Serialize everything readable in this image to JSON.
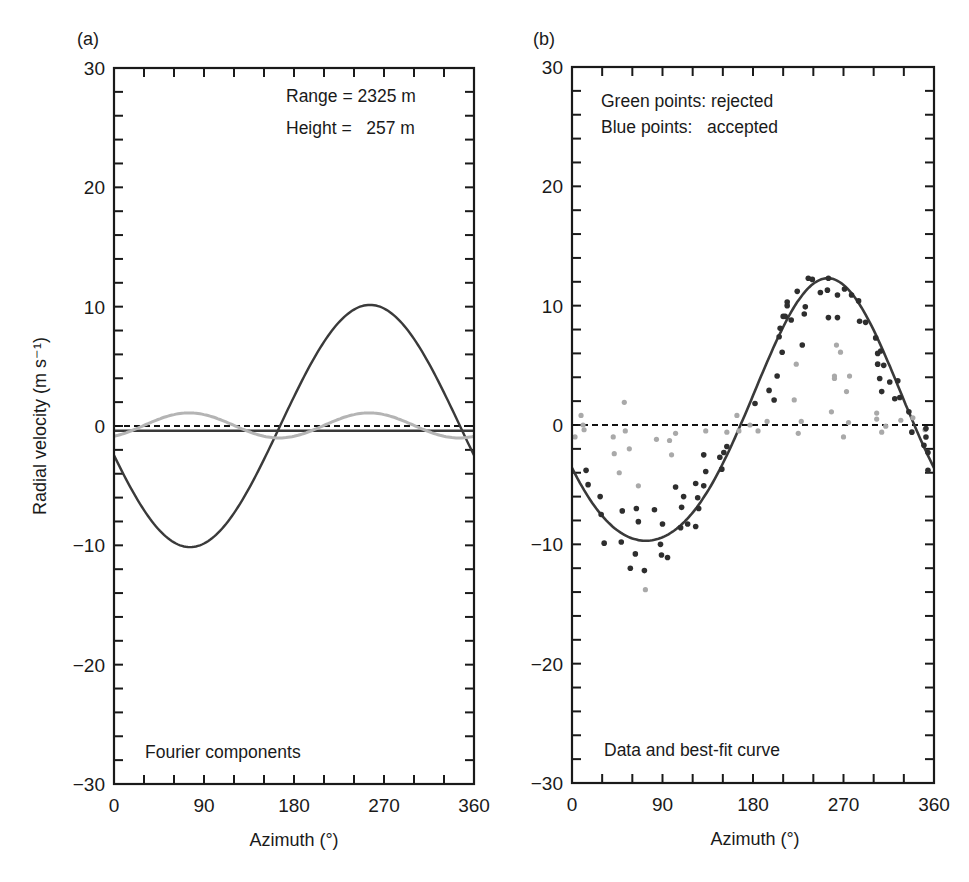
{
  "figure": {
    "ylabel": "Radial velocity (m s⁻¹)",
    "xlabel": "Azimuth (°)"
  },
  "colors": {
    "frame": "#1a1a1a",
    "dark_curve": "#3a3a3a",
    "light_curve": "#b4b4b4",
    "accepted_points": "#2e2e2e",
    "rejected_points": "#a9a9a9",
    "zero_line": "#111111"
  },
  "chart_data": [
    {
      "type": "line",
      "panel_label": "(a)",
      "title": "Fourier components",
      "annotations": [
        "Range = 2325 m",
        "Height =   257 m"
      ],
      "xlabel": "Azimuth (°)",
      "ylabel": "Radial velocity (m s⁻¹)",
      "xlim": [
        0,
        360
      ],
      "ylim": [
        -30,
        30
      ],
      "xticks": [
        0,
        90,
        180,
        270,
        360
      ],
      "yticks": [
        -30,
        -20,
        -10,
        0,
        10,
        20,
        30
      ],
      "minor_xtick_step": 30,
      "minor_ytick_step": 2,
      "zero_line": "dashed",
      "series": [
        {
          "name": "mean (zeroth harmonic)",
          "style": "solid-dark",
          "model": {
            "mean": -0.4,
            "a1": 0,
            "p1": 0,
            "a2": 0,
            "p2": 0
          }
        },
        {
          "name": "first harmonic",
          "style": "solid-dark",
          "model": {
            "mean": 0,
            "a1": 10.15,
            "p1": 256,
            "a2": 0,
            "p2": 0
          }
        },
        {
          "name": "second harmonic",
          "style": "solid-light",
          "model": {
            "mean": 0.05,
            "a1": 0,
            "p1": 0,
            "a2": 1.05,
            "p2": 75
          }
        }
      ],
      "key_points": {
        "first_harmonic_min": {
          "azimuth": 76,
          "value": -10.1
        },
        "first_harmonic_max": {
          "azimuth": 256,
          "value": 10.2
        },
        "second_harmonic_peaks_azimuth": [
          75,
          255
        ],
        "second_harmonic_amplitude": 1.05
      }
    },
    {
      "type": "scatter",
      "panel_label": "(b)",
      "title": "Data and best-fit curve",
      "annotations": [
        "Green points: rejected",
        "Blue points:   accepted"
      ],
      "xlabel": "Azimuth (°)",
      "xlim": [
        0,
        360
      ],
      "ylim": [
        -30,
        30
      ],
      "xticks": [
        0,
        90,
        180,
        270,
        360
      ],
      "yticks": [
        -30,
        -20,
        -10,
        0,
        10,
        20,
        30
      ],
      "minor_xtick_step": 30,
      "minor_ytick_step": 2,
      "zero_line": "dashed",
      "fit_curve": {
        "name": "best-fit curve",
        "model": {
          "mean": 0.3,
          "a1": 11.0,
          "p1": 254,
          "a2": 1.0,
          "p2": 255
        },
        "min": {
          "azimuth": 77.5,
          "value": -9.9
        },
        "max": {
          "azimuth": 255,
          "value": 12.1
        }
      },
      "series": [
        {
          "name": "accepted",
          "points": [
            [
              14,
              -3.8
            ],
            [
              16,
              -5.0
            ],
            [
              28,
              -6.0
            ],
            [
              29,
              -7.5
            ],
            [
              32,
              -9.9
            ],
            [
              49,
              -9.8
            ],
            [
              50,
              -7.2
            ],
            [
              58,
              -12.0
            ],
            [
              63,
              -10.8
            ],
            [
              64,
              -7.0
            ],
            [
              66,
              -8.1
            ],
            [
              72,
              -12.2
            ],
            [
              82,
              -7.1
            ],
            [
              88,
              -10.0
            ],
            [
              89,
              -10.9
            ],
            [
              90,
              -8.3
            ],
            [
              95,
              -11.1
            ],
            [
              103,
              -5.2
            ],
            [
              108,
              -8.6
            ],
            [
              109,
              -6.9
            ],
            [
              111,
              -6.0
            ],
            [
              115,
              -8.3
            ],
            [
              123,
              -4.9
            ],
            [
              123,
              -8.5
            ],
            [
              125,
              -6.1
            ],
            [
              126,
              -7.0
            ],
            [
              131,
              -2.5
            ],
            [
              131,
              -5.1
            ],
            [
              133,
              -3.9
            ],
            [
              147,
              -2.7
            ],
            [
              149,
              -3.7
            ],
            [
              151,
              -2.3
            ],
            [
              154,
              -1.8
            ],
            [
              182,
              1.8
            ],
            [
              196,
              2.9
            ],
            [
              201,
              2.1
            ],
            [
              204,
              4.1
            ],
            [
              206,
              7.4
            ],
            [
              207,
              8.1
            ],
            [
              209,
              6.1
            ],
            [
              210,
              9.1
            ],
            [
              212,
              9.1
            ],
            [
              214,
              10.3
            ],
            [
              214,
              10.0
            ],
            [
              218,
              8.8
            ],
            [
              224,
              11.2
            ],
            [
              229,
              6.7
            ],
            [
              231,
              9.3
            ],
            [
              232,
              9.9
            ],
            [
              235,
              12.3
            ],
            [
              239,
              12.2
            ],
            [
              247,
              11.1
            ],
            [
              254,
              11.3
            ],
            [
              255,
              12.3
            ],
            [
              255,
              9.0
            ],
            [
              264,
              10.9
            ],
            [
              264,
              9.0
            ],
            [
              271,
              11.4
            ],
            [
              278,
              10.9
            ],
            [
              285,
              10.4
            ],
            [
              286,
              8.7
            ],
            [
              292,
              8.6
            ],
            [
              302,
              7.3
            ],
            [
              304,
              6.0
            ],
            [
              304,
              5.1
            ],
            [
              306,
              3.9
            ],
            [
              307,
              6.2
            ],
            [
              308,
              2.8
            ],
            [
              310,
              5.0
            ],
            [
              316,
              3.6
            ],
            [
              321,
              2.2
            ],
            [
              324,
              3.7
            ],
            [
              326,
              2.3
            ],
            [
              335,
              1.1
            ],
            [
              338,
              -0.6
            ],
            [
              350,
              -1.7
            ],
            [
              352,
              -0.3
            ],
            [
              352,
              -1.0
            ],
            [
              354,
              -2.3
            ],
            [
              354,
              -3.8
            ]
          ]
        },
        {
          "name": "rejected",
          "points": [
            [
              3,
              -1.0
            ],
            [
              9,
              0.8
            ],
            [
              11,
              0.0
            ],
            [
              12,
              -0.4
            ],
            [
              41,
              -1.0
            ],
            [
              42,
              -2.4
            ],
            [
              47,
              -4.0
            ],
            [
              52,
              1.9
            ],
            [
              53,
              -0.5
            ],
            [
              57,
              -2.0
            ],
            [
              66,
              -5.1
            ],
            [
              73,
              -13.8
            ],
            [
              84,
              -1.2
            ],
            [
              97,
              -1.3
            ],
            [
              99,
              -2.5
            ],
            [
              103,
              -0.7
            ],
            [
              133,
              -0.5
            ],
            [
              154,
              -0.6
            ],
            [
              164,
              0.8
            ],
            [
              166,
              -0.5
            ],
            [
              177,
              0.0
            ],
            [
              185,
              -0.5
            ],
            [
              194,
              0.3
            ],
            [
              221,
              2.1
            ],
            [
              223,
              5.1
            ],
            [
              225,
              -0.7
            ],
            [
              228,
              0.3
            ],
            [
              258,
              1.1
            ],
            [
              261,
              4.1
            ],
            [
              261,
              3.9
            ],
            [
              263,
              6.7
            ],
            [
              267,
              6.1
            ],
            [
              270,
              -1.0
            ],
            [
              273,
              2.8
            ],
            [
              275,
              0.2
            ],
            [
              276,
              4.1
            ],
            [
              303,
              1.0
            ],
            [
              303,
              0.5
            ],
            [
              308,
              -0.6
            ],
            [
              312,
              -0.1
            ],
            [
              327,
              0.4
            ],
            [
              339,
              0.6
            ],
            [
              351,
              -0.4
            ]
          ]
        }
      ]
    }
  ]
}
